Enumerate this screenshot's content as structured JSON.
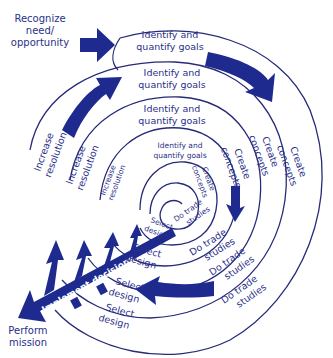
{
  "diagram": {
    "type": "spiral-process",
    "colors": {
      "ink": "#2a2f8a",
      "arrow": "#1f2a8f",
      "line": "#262a78",
      "background": "#ffffff"
    },
    "entry": {
      "line1": "Recognize",
      "line2": "need/",
      "line3": "opportunity"
    },
    "exit": {
      "line1": "Perform",
      "line2": "mission"
    },
    "implement": "Implement decisions",
    "loops": [
      {
        "goals1": "Identify and",
        "goals2": "quantify goals",
        "concepts1": "Create",
        "concepts2": "concepts",
        "trade1": "Do trade",
        "trade2": "studies",
        "select1": "Select",
        "select2": "design",
        "resolution1": "Increase",
        "resolution2": "resolution"
      },
      {
        "goals1": "Identify and",
        "goals2": "quantify goals",
        "concepts1": "Create",
        "concepts2": "concepts",
        "trade1": "Do trade",
        "trade2": "studies",
        "select1": "Select",
        "select2": "design",
        "resolution1": "Increase",
        "resolution2": "resolution"
      },
      {
        "goals1": "Identify and",
        "goals2": "quantify goals",
        "concepts1": "Create",
        "concepts2": "concepts",
        "trade1": "Do trade",
        "trade2": "studies",
        "select1": "Select",
        "select2": "design",
        "resolution1": "Increase",
        "resolution2": "resolution"
      },
      {
        "goals1": "Identify and",
        "goals2": "quantify goals",
        "concepts1": "Create",
        "concepts2": "concepts",
        "trade1": "Do trade",
        "trade2": "studies",
        "select1": "Select",
        "select2": "design"
      }
    ]
  }
}
